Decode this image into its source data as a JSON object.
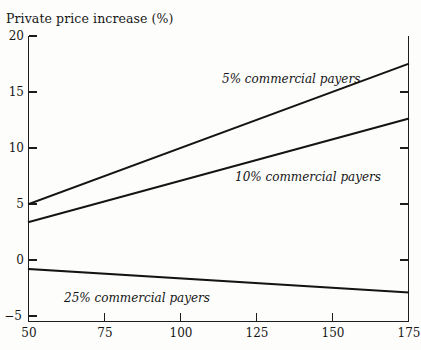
{
  "chart_data": {
    "type": "line",
    "title": "",
    "subtitle": "",
    "xlabel": "",
    "ylabel": "Private price increase (%)",
    "xlim": [
      50,
      175
    ],
    "ylim": [
      -5,
      20
    ],
    "xticks": [
      "50",
      "75",
      "100",
      "125",
      "150",
      "175"
    ],
    "yticks": [
      "20",
      "15",
      "10",
      "5",
      "0",
      "−5"
    ],
    "xtick_values": [
      50,
      75,
      100,
      125,
      150,
      175
    ],
    "ytick_values": [
      20,
      15,
      10,
      5,
      0,
      -5
    ],
    "grid": false,
    "legend_position": "inline-annotations",
    "line_color": "#1a1a1a",
    "background_color": "#fdfdfc",
    "series": [
      {
        "name": "5% commercial payers",
        "x": [
          50,
          175
        ],
        "values": [
          5.0,
          17.5
        ],
        "label_x": 125,
        "label_y": 16.1
      },
      {
        "name": "10% commercial payers",
        "x": [
          50,
          175
        ],
        "values": [
          3.4,
          12.6
        ],
        "label_x": 127,
        "label_y": 7.6
      },
      {
        "name": "25% commercial payers",
        "x": [
          50,
          175
        ],
        "values": [
          -0.8,
          -2.9
        ],
        "label_x": 68,
        "label_y": -3.3
      }
    ]
  },
  "axis": {
    "y_caption": "Private price increase (%)",
    "y_ticks": [
      {
        "text": "20"
      },
      {
        "text": "15"
      },
      {
        "text": "10"
      },
      {
        "text": "5"
      },
      {
        "text": "0"
      },
      {
        "text": "−5"
      }
    ],
    "x_ticks": [
      {
        "text": "50"
      },
      {
        "text": "75"
      },
      {
        "text": "100"
      },
      {
        "text": "125"
      },
      {
        "text": "150"
      },
      {
        "text": "175"
      }
    ]
  },
  "annotations": [
    {
      "text": "5% commercial payers"
    },
    {
      "text": "10% commercial payers"
    },
    {
      "text": "25% commercial payers"
    }
  ]
}
